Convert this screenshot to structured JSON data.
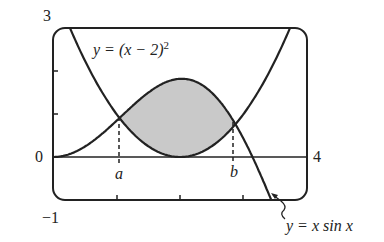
{
  "chart_data": {
    "type": "line",
    "title": "",
    "xlabel": "",
    "ylabel": "",
    "xlim": [
      0,
      4
    ],
    "ylim": [
      -1,
      3
    ],
    "x_ticks": [
      1,
      2,
      3
    ],
    "grid": false,
    "series": [
      {
        "name": "y = (x − 2)^2",
        "formula": "(x-2)^2"
      },
      {
        "name": "y = x sin x",
        "formula": "x*sin(x)"
      }
    ],
    "shaded_region": {
      "between": [
        "y = x sin x",
        "y = (x − 2)^2"
      ],
      "from": "a",
      "to": "b",
      "color": "#c8c8c8"
    },
    "annotations": [
      {
        "text": "a",
        "x": 1.0,
        "note": "left intersection, dashed line to x-axis"
      },
      {
        "text": "b",
        "x": 2.85,
        "note": "right intersection, dashed line to x-axis"
      }
    ],
    "axis_labels": {
      "y_top": "3",
      "y_bottom": "-1",
      "x_left": "0",
      "x_right": "4"
    }
  },
  "labels": {
    "y_top": "3",
    "y_bottom": "−1",
    "x_zero": "0",
    "x_four": "4",
    "a": "a",
    "b": "b",
    "curve1": "y = (x − 2)",
    "curve1_exp": "2",
    "curve2": "y = x sin x"
  }
}
